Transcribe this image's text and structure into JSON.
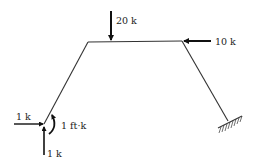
{
  "diagram": {
    "type": "structural-frame",
    "members": [
      {
        "id": "left-leg",
        "from": [
          44,
          124
        ],
        "to": [
          88,
          42
        ]
      },
      {
        "id": "top-beam",
        "from": [
          88,
          42
        ],
        "to": [
          182,
          41
        ]
      },
      {
        "id": "right-leg",
        "from": [
          182,
          41
        ],
        "to": [
          228,
          121
        ]
      }
    ],
    "support": {
      "type": "fixed",
      "location": "right-base"
    },
    "loads": [
      {
        "id": "load-20k",
        "label": "20 k",
        "direction": "down",
        "location": "top-beam"
      },
      {
        "id": "load-10k",
        "label": "10 k",
        "direction": "left",
        "location": "top-right-corner"
      },
      {
        "id": "load-1k-horizontal",
        "label": "1 k",
        "direction": "right",
        "location": "left-base"
      },
      {
        "id": "load-1k-vertical",
        "label": "1 k",
        "direction": "up",
        "location": "left-base"
      },
      {
        "id": "moment-1ftk",
        "label": "1 ft·k",
        "direction": "counterclockwise",
        "location": "left-base"
      }
    ]
  }
}
